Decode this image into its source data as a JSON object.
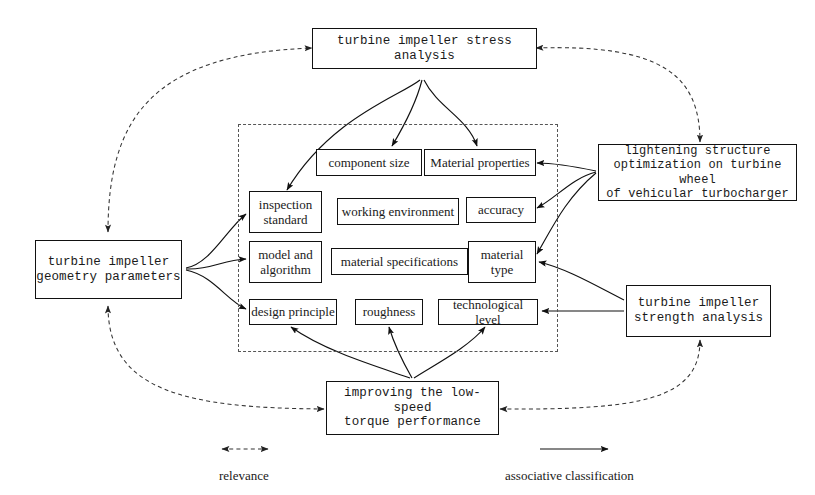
{
  "diagram": {
    "outer_nodes": [
      {
        "id": "stress-analysis",
        "label": "turbine impeller stress analysis",
        "lines": [
          "turbine impeller stress analysis"
        ]
      },
      {
        "id": "geometry-parameters",
        "label": "turbine impeller geometry parameters",
        "lines": [
          "turbine impeller",
          "geometry parameters"
        ]
      },
      {
        "id": "lightening-structure",
        "label": "lightening structure optimization on turbine wheel of vehicular turbocharger",
        "lines": [
          "lightening structure",
          "optimization on turbine wheel",
          "of vehicular turbocharger"
        ]
      },
      {
        "id": "strength-analysis",
        "label": "turbine impeller strength analysis",
        "lines": [
          "turbine impeller",
          "strength analysis"
        ]
      },
      {
        "id": "low-speed-torque",
        "label": "improving the low-speed torque performance",
        "lines": [
          "improving the low-speed",
          "torque performance"
        ]
      }
    ],
    "inner_nodes": [
      {
        "id": "component-size",
        "label": "component size",
        "lines": [
          "component size"
        ]
      },
      {
        "id": "material-properties",
        "label": "Material properties",
        "lines": [
          "Material properties"
        ]
      },
      {
        "id": "inspection-standard",
        "label": "inspection standard",
        "lines": [
          "inspection",
          "standard"
        ]
      },
      {
        "id": "working-environment",
        "label": "working environment",
        "lines": [
          "working environment"
        ]
      },
      {
        "id": "accuracy",
        "label": "accuracy",
        "lines": [
          "accuracy"
        ]
      },
      {
        "id": "model-and-algorithm",
        "label": "model and algorithm",
        "lines": [
          "model and",
          "algorithm"
        ]
      },
      {
        "id": "material-specifications",
        "label": "material specifications",
        "lines": [
          "material specifications"
        ]
      },
      {
        "id": "material-type",
        "label": "material type",
        "lines": [
          "material",
          "type"
        ]
      },
      {
        "id": "design-principle",
        "label": "design principle",
        "lines": [
          "design principle"
        ]
      },
      {
        "id": "roughness",
        "label": "roughness",
        "lines": [
          "roughness"
        ]
      },
      {
        "id": "technological-level",
        "label": "technological level",
        "lines": [
          "technological level"
        ]
      }
    ],
    "legend": {
      "relevance": "relevance",
      "associative_classification": "associative classification"
    },
    "colors": {
      "line": "#111111",
      "dashed_line": "#555555",
      "box_border": "#111111",
      "background": "#ffffff",
      "text": "#1a1a1a"
    }
  }
}
